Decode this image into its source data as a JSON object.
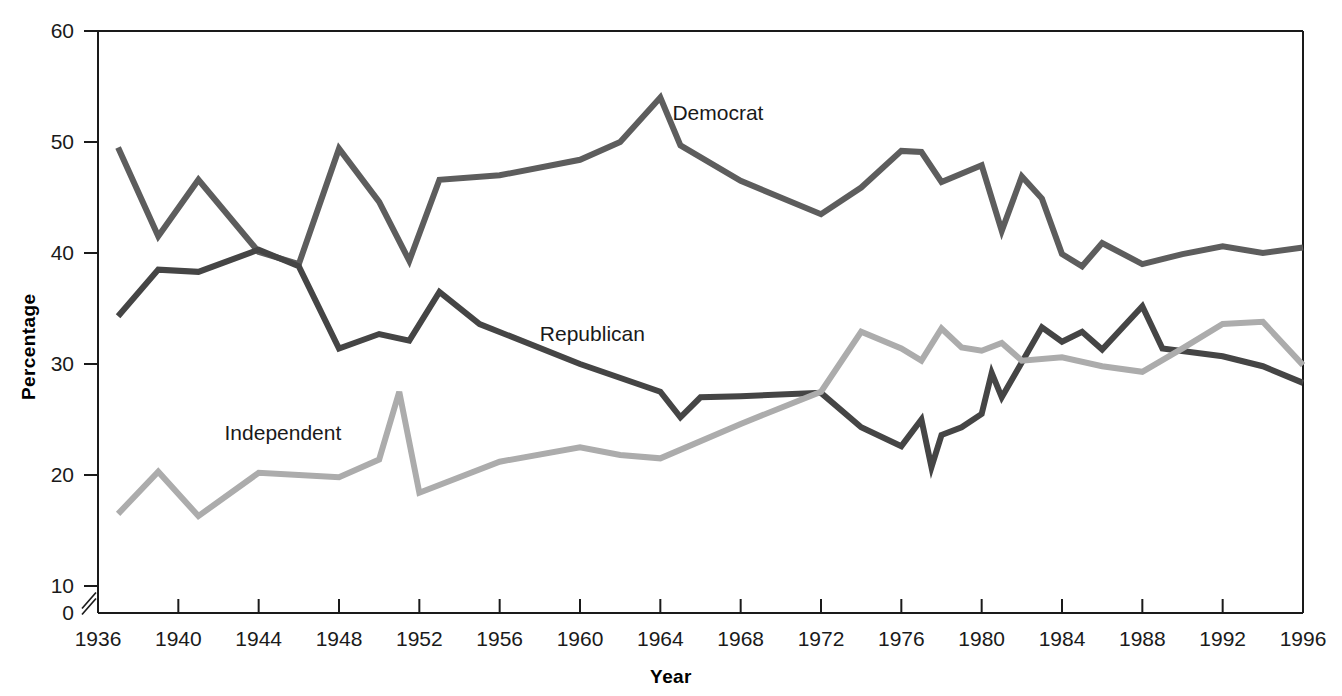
{
  "chart_data": {
    "type": "line",
    "title": "",
    "xlabel": "Year",
    "ylabel": "Percentage",
    "xlim": [
      1936,
      1996
    ],
    "ylim": [
      0,
      60
    ],
    "y_axis_break": true,
    "y_break_between": [
      0,
      10
    ],
    "grid": false,
    "legend_position": "inline-labels",
    "y_ticks": [
      60,
      50,
      40,
      30,
      20,
      10,
      0
    ],
    "x_ticks": [
      1936,
      1940,
      1944,
      1948,
      1952,
      1956,
      1960,
      1964,
      1968,
      1972,
      1976,
      1980,
      1984,
      1988,
      1992,
      1996
    ],
    "colors": {
      "Democrat": "#5d5d5d",
      "Republican": "#454545",
      "Independent": "#acacac",
      "axis": "#1a1a1a",
      "background": "#ffffff"
    },
    "series": [
      {
        "name": "Democrat",
        "color": "#5d5d5d",
        "label_x": 1964.6,
        "label_y": 52.5,
        "points": [
          [
            1937,
            49.5
          ],
          [
            1939,
            41.5
          ],
          [
            1941,
            46.6
          ],
          [
            1944,
            40.1
          ],
          [
            1946,
            39.0
          ],
          [
            1948,
            49.4
          ],
          [
            1950,
            44.6
          ],
          [
            1951.5,
            39.3
          ],
          [
            1953,
            46.6
          ],
          [
            1956,
            47.0
          ],
          [
            1960,
            48.4
          ],
          [
            1962,
            50.0
          ],
          [
            1964,
            54.0
          ],
          [
            1965,
            49.7
          ],
          [
            1968,
            46.5
          ],
          [
            1972,
            43.5
          ],
          [
            1974,
            45.9
          ],
          [
            1976,
            49.2
          ],
          [
            1977,
            49.1
          ],
          [
            1978,
            46.4
          ],
          [
            1980,
            47.9
          ],
          [
            1981,
            42.0
          ],
          [
            1982,
            46.9
          ],
          [
            1983,
            44.9
          ],
          [
            1984,
            39.9
          ],
          [
            1985,
            38.8
          ],
          [
            1986,
            40.9
          ],
          [
            1988,
            39.0
          ],
          [
            1990,
            39.9
          ],
          [
            1992,
            40.6
          ],
          [
            1994,
            40.0
          ],
          [
            1996,
            40.5
          ]
        ]
      },
      {
        "name": "Republican",
        "color": "#454545",
        "label_x": 1958.0,
        "label_y": 32.6,
        "points": [
          [
            1937,
            34.3
          ],
          [
            1939,
            38.5
          ],
          [
            1941,
            38.3
          ],
          [
            1944,
            40.3
          ],
          [
            1946,
            38.8
          ],
          [
            1948,
            31.4
          ],
          [
            1950,
            32.7
          ],
          [
            1951.5,
            32.1
          ],
          [
            1953,
            36.5
          ],
          [
            1955,
            33.6
          ],
          [
            1960,
            30.0
          ],
          [
            1964,
            27.5
          ],
          [
            1965,
            25.2
          ],
          [
            1966,
            27.0
          ],
          [
            1968,
            27.1
          ],
          [
            1972,
            27.4
          ],
          [
            1974,
            24.3
          ],
          [
            1976,
            22.6
          ],
          [
            1977,
            25.0
          ],
          [
            1977.5,
            20.7
          ],
          [
            1978,
            23.6
          ],
          [
            1979,
            24.3
          ],
          [
            1980,
            25.5
          ],
          [
            1980.5,
            29.2
          ],
          [
            1981,
            27.0
          ],
          [
            1983,
            33.3
          ],
          [
            1984,
            32.0
          ],
          [
            1985,
            32.9
          ],
          [
            1986,
            31.3
          ],
          [
            1988,
            35.2
          ],
          [
            1989,
            31.4
          ],
          [
            1992,
            30.7
          ],
          [
            1994,
            29.8
          ],
          [
            1996,
            28.3
          ]
        ]
      },
      {
        "name": "Independent",
        "color": "#acacac",
        "label_x": 1942.3,
        "label_y": 23.7,
        "points": [
          [
            1937,
            16.5
          ],
          [
            1939,
            20.3
          ],
          [
            1941,
            16.3
          ],
          [
            1944,
            20.2
          ],
          [
            1946,
            20.0
          ],
          [
            1948,
            19.8
          ],
          [
            1950,
            21.4
          ],
          [
            1951,
            27.5
          ],
          [
            1952,
            18.4
          ],
          [
            1956,
            21.2
          ],
          [
            1960,
            22.5
          ],
          [
            1962,
            21.8
          ],
          [
            1964,
            21.5
          ],
          [
            1968,
            24.6
          ],
          [
            1972,
            27.5
          ],
          [
            1974,
            32.9
          ],
          [
            1976,
            31.4
          ],
          [
            1977,
            30.3
          ],
          [
            1978,
            33.2
          ],
          [
            1979,
            31.5
          ],
          [
            1980,
            31.2
          ],
          [
            1981,
            31.9
          ],
          [
            1982,
            30.3
          ],
          [
            1984,
            30.6
          ],
          [
            1986,
            29.8
          ],
          [
            1988,
            29.3
          ],
          [
            1990,
            31.4
          ],
          [
            1992,
            33.6
          ],
          [
            1994,
            33.8
          ],
          [
            1996,
            29.9
          ]
        ]
      }
    ]
  }
}
